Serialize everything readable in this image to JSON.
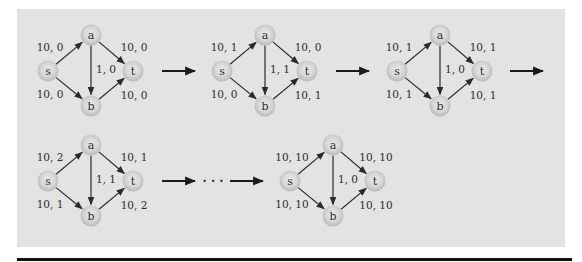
{
  "colors": {
    "panel": "#e3e3e3",
    "node_edge": "#bdbdbd",
    "node_center": "#e6e6e6",
    "edge": "#2a2a2a",
    "text": "#2a2a2a",
    "rule": "#111111"
  },
  "node_labels": {
    "s": "s",
    "a": "a",
    "b": "b",
    "t": "t"
  },
  "graphs": [
    {
      "id": "g1",
      "row": 1,
      "origin": [
        48,
        71
      ],
      "edges": {
        "sa": "10, 0",
        "sb": "10, 0",
        "ab": "1, 0",
        "at": "10, 0",
        "bt": "10, 0"
      }
    },
    {
      "id": "g2",
      "row": 1,
      "origin": [
        222,
        71
      ],
      "edges": {
        "sa": "10, 1",
        "sb": "10, 0",
        "ab": "1, 1",
        "at": "10, 0",
        "bt": "10, 1"
      }
    },
    {
      "id": "g3",
      "row": 1,
      "origin": [
        397,
        71
      ],
      "edges": {
        "sa": "10, 1",
        "sb": "10, 1",
        "ab": "1, 0",
        "at": "10, 1",
        "bt": "10, 1"
      }
    },
    {
      "id": "g4",
      "row": 2,
      "origin": [
        48,
        181
      ],
      "edges": {
        "sa": "10, 2",
        "sb": "10, 1",
        "ab": "1, 1",
        "at": "10, 1",
        "bt": "10, 2"
      }
    },
    {
      "id": "g5",
      "row": 2,
      "origin": [
        290,
        181
      ],
      "edges": {
        "sa": "10, 10",
        "sb": "10, 10",
        "ab": "1, 0",
        "at": "10, 10",
        "bt": "10, 10"
      }
    }
  ],
  "transitions": [
    {
      "from": [
        162,
        71
      ],
      "to": [
        195,
        71
      ]
    },
    {
      "from": [
        336,
        71
      ],
      "to": [
        369,
        71
      ]
    },
    {
      "from": [
        510,
        71
      ],
      "to": [
        543,
        71
      ]
    },
    {
      "from": [
        162,
        181
      ],
      "to": [
        195,
        181
      ]
    },
    {
      "from": [
        230,
        181
      ],
      "to": [
        263,
        181
      ]
    }
  ],
  "ellipsis": {
    "text": "· · ·",
    "x": 213,
    "y": 181
  }
}
